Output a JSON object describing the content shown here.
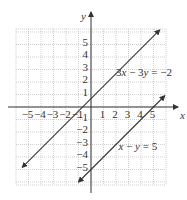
{
  "chart_data": {
    "type": "line",
    "title": "",
    "xlabel": "x",
    "ylabel": "y",
    "xlim": [
      -6,
      6
    ],
    "ylim": [
      -6,
      6
    ],
    "grid": true,
    "x_ticks": [
      -5,
      -4,
      -3,
      -2,
      -1,
      1,
      2,
      3,
      4,
      5
    ],
    "y_ticks": [
      5,
      4,
      3,
      2,
      1,
      -1,
      -2,
      -3,
      -4,
      -5
    ],
    "x_tick_labels": [
      "−5",
      "−4",
      "−3",
      "−2",
      "−1",
      "1",
      "2",
      "3",
      "4",
      "5"
    ],
    "y_tick_labels": [
      "5",
      "4",
      "3",
      "2",
      "1",
      "−1",
      "−2",
      "−3",
      "−4",
      "−5"
    ],
    "series": [
      {
        "name": "3x − 3y = −2",
        "equation": "y = x + 2/3",
        "slope": 1,
        "intercept": 0.6667,
        "x": [
          -5.5,
          5.5
        ],
        "y": [
          -4.83,
          6.17
        ],
        "label": "3x − 3y = −2",
        "label_pos": [
          2,
          2.5
        ]
      },
      {
        "name": "x − y = 5",
        "equation": "y = x − 5",
        "slope": 1,
        "intercept": -5,
        "x": [
          -1.0,
          5.9
        ],
        "y": [
          -6.0,
          0.9
        ],
        "label": "x − y = 5",
        "label_pos": [
          2.2,
          -3.4
        ]
      }
    ],
    "line_color": "#333333",
    "grid_color": "#bbbbbb",
    "axis_color": "#333333"
  }
}
